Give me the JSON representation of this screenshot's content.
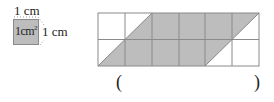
{
  "legend": {
    "top_label": "1 cm",
    "right_label": "1 cm",
    "area_label": "1cm",
    "area_exponent": "2"
  },
  "grid": {
    "columns": 6,
    "rows": 2,
    "cell_size_px": 27,
    "shaded_shape": "parallelogram",
    "fill_color": "#bdbdbd",
    "line_color": "#888888"
  },
  "answer": {
    "open_paren": "(",
    "close_paren": ")",
    "value": ""
  }
}
